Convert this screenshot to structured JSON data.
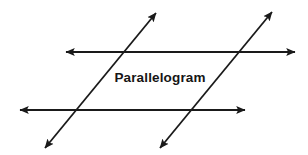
{
  "figure": {
    "title": "Parallelogram",
    "background_color": "#ffffff",
    "stroke_color": "#1a1a1a",
    "label_color": "#161616",
    "canvas": {
      "width": 308,
      "height": 155
    },
    "label": {
      "text": "Parallelogram",
      "x": 160,
      "y": 77
    },
    "lines": [
      {
        "name": "top-horizontal-line",
        "role": "first parallel transversal",
        "x1": 66,
        "y1": 52,
        "x2": 295,
        "y2": 52,
        "arrow_start": true,
        "arrow_end": true,
        "stroke_width": 1.8
      },
      {
        "name": "bottom-horizontal-line",
        "role": "second parallel transversal",
        "x1": 20,
        "y1": 110,
        "x2": 245,
        "y2": 110,
        "arrow_start": true,
        "arrow_end": true,
        "stroke_width": 1.8
      },
      {
        "name": "left-diagonal-line",
        "role": "first parallel side",
        "x1": 45,
        "y1": 148,
        "x2": 156,
        "y2": 13,
        "arrow_start": true,
        "arrow_end": true,
        "stroke_width": 1.8
      },
      {
        "name": "right-diagonal-line",
        "role": "second parallel side",
        "x1": 160,
        "y1": 148,
        "x2": 272,
        "y2": 12,
        "arrow_start": true,
        "arrow_end": true,
        "stroke_width": 1.8
      }
    ],
    "intersections": [
      {
        "name": "top-left-vertex",
        "x": 124,
        "y": 52
      },
      {
        "name": "top-right-vertex",
        "x": 240,
        "y": 52
      },
      {
        "name": "bottom-left-vertex",
        "x": 77,
        "y": 110
      },
      {
        "name": "bottom-right-vertex",
        "x": 192,
        "y": 110
      }
    ]
  }
}
